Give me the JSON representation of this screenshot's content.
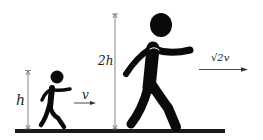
{
  "labels": {
    "small_height": "h",
    "big_height": "2h",
    "small_velocity": "v",
    "big_velocity": "√2v"
  },
  "colors": {
    "figure": "#0a0a0a",
    "ground": "#1a1a1a",
    "arrow": "#555555"
  }
}
